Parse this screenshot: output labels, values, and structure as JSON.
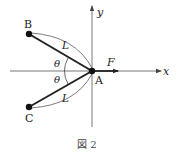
{
  "figure": {
    "caption": "図 2",
    "axes": {
      "x_label": "x",
      "y_label": "y"
    },
    "points": {
      "A": {
        "label": "A"
      },
      "B": {
        "label": "B"
      },
      "C": {
        "label": "C"
      }
    },
    "force_label": "F",
    "length_label_upper": "L",
    "length_label_lower": "L",
    "angle_label_upper": "θ",
    "angle_label_lower": "θ",
    "colors": {
      "line": "#222222",
      "axis": "#555555",
      "background": "#ffffff"
    }
  }
}
